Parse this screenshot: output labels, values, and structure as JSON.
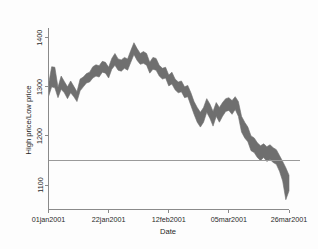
{
  "chart_data": {
    "type": "area",
    "title": "",
    "subtitle": "",
    "xlabel": "Date",
    "ylabel": "High price/Low price",
    "legend": [],
    "legend_position": "none",
    "grid": false,
    "band_color": "#6f6f6f",
    "background_color": "#fdfdfd",
    "axis_color": "#8a8a8a",
    "reference_line": {
      "value": 1150,
      "orientation": "horizontal",
      "color": "#9a9a9a"
    },
    "xlim": [
      "01jan2001",
      "26mar2001"
    ],
    "ylim": [
      1050,
      1420
    ],
    "yticks": [
      1100,
      1200,
      1300,
      1400
    ],
    "ytick_labels": [
      "1100",
      "1200",
      "1300",
      "1400"
    ],
    "xticks": [
      "01jan2001",
      "22jan2001",
      "12feb2001",
      "05mar2001",
      "26mar2001"
    ],
    "xtick_labels": [
      "01jan2001",
      "22jan2001",
      "12feb2001",
      "05mar2001",
      "26mar2001"
    ],
    "series": [
      {
        "name": "High price",
        "values": [
          1305,
          1341,
          1340,
          1299,
          1322,
          1311,
          1300,
          1312,
          1301,
          1290,
          1316,
          1320,
          1327,
          1330,
          1341,
          1345,
          1343,
          1352,
          1350,
          1340,
          1358,
          1368,
          1357,
          1355,
          1360,
          1357,
          1374,
          1390,
          1378,
          1368,
          1372,
          1368,
          1350,
          1360,
          1358,
          1344,
          1338,
          1340,
          1324,
          1330,
          1316,
          1310,
          1312,
          1300,
          1303,
          1288,
          1270,
          1258,
          1248,
          1258,
          1276,
          1265,
          1250,
          1268,
          1258,
          1268,
          1276,
          1278,
          1272,
          1280,
          1270,
          1240,
          1228,
          1218,
          1200,
          1196,
          1186,
          1180,
          1184,
          1178,
          1182,
          1176,
          1172,
          1160,
          1148,
          1135,
          1120
        ]
      },
      {
        "name": "Low price",
        "values": [
          1280,
          1300,
          1298,
          1278,
          1295,
          1288,
          1276,
          1288,
          1280,
          1270,
          1292,
          1300,
          1308,
          1310,
          1318,
          1322,
          1320,
          1330,
          1328,
          1318,
          1336,
          1344,
          1334,
          1332,
          1338,
          1334,
          1350,
          1366,
          1354,
          1346,
          1348,
          1344,
          1328,
          1336,
          1334,
          1322,
          1316,
          1318,
          1302,
          1306,
          1294,
          1288,
          1290,
          1278,
          1280,
          1262,
          1244,
          1228,
          1218,
          1228,
          1248,
          1236,
          1220,
          1240,
          1228,
          1240,
          1250,
          1252,
          1244,
          1254,
          1240,
          1208,
          1196,
          1188,
          1170,
          1166,
          1156,
          1150,
          1156,
          1148,
          1152,
          1146,
          1142,
          1128,
          1108,
          1070,
          1088
        ]
      }
    ]
  }
}
